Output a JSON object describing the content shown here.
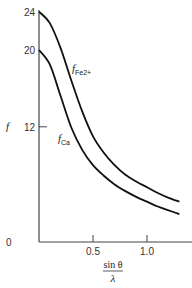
{
  "chart_data": {
    "type": "line",
    "title": "",
    "xlabel": "sin θ / λ",
    "ylabel": "f",
    "xlim": [
      0,
      1.3
    ],
    "ylim": [
      0,
      24
    ],
    "x_ticks": [
      "0.5",
      "1.0"
    ],
    "y_ticks": [
      "0",
      "12",
      "20",
      "24"
    ],
    "grid": false,
    "legend": "inline labels",
    "series": [
      {
        "name": "f_Fe2+",
        "label_main": "f",
        "label_sub": "Fe2+",
        "x": [
          0,
          0.1,
          0.2,
          0.3,
          0.4,
          0.5,
          0.6,
          0.7,
          0.8,
          0.9,
          1.0,
          1.1,
          1.2,
          1.3
        ],
        "values": [
          24,
          22.8,
          20.2,
          16.8,
          13.6,
          11.0,
          9.3,
          8.0,
          7.0,
          6.3,
          5.7,
          5.1,
          4.6,
          4.2
        ]
      },
      {
        "name": "f_Ca",
        "label_main": "f",
        "label_sub": "Ca",
        "x": [
          0,
          0.1,
          0.2,
          0.3,
          0.4,
          0.5,
          0.6,
          0.7,
          0.8,
          0.9,
          1.0,
          1.1,
          1.2,
          1.3
        ],
        "values": [
          20,
          18.5,
          15.2,
          11.9,
          9.6,
          8.0,
          6.9,
          6.0,
          5.3,
          4.7,
          4.2,
          3.7,
          3.3,
          2.9
        ]
      }
    ]
  },
  "axis": {
    "y_label": "f",
    "x_label_num": "sin θ",
    "x_label_den": "λ",
    "origin_label": "0"
  }
}
